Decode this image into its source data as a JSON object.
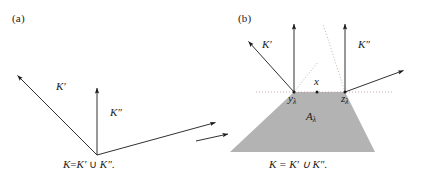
{
  "figure": {
    "background_color": "#ffffff",
    "line_color": "#1a1a1a",
    "shade_color": "#b0b0b0",
    "dotted_color": "#c8a8a8"
  },
  "panel_a": {
    "label": "(a)",
    "cone_left_label": "K′",
    "cone_right_label": "K″",
    "caption_k": "K",
    "caption_eq": "=",
    "caption_kp": "K′",
    "caption_union": "∪",
    "caption_kpp": "K″",
    "caption_period": ".",
    "caption_full": "K = K′ ∪ K″.",
    "vertex": [
      97,
      155
    ],
    "ray_upper_left_tip": [
      15,
      73
    ],
    "ray_vertical_tip": [
      97,
      86
    ],
    "ray_lower_right_tip": [
      218,
      121
    ]
  },
  "panel_b": {
    "label": "(b)",
    "cone_left_label": "K′",
    "cone_right_label": "K″",
    "point_x_label": "x",
    "vertex_left_label": "y",
    "vertex_left_sub": "λ",
    "vertex_right_label": "z",
    "vertex_right_sub": "λ",
    "region_label": "A",
    "region_sub": "λ",
    "caption_full": "K = K′ ∪ K″.",
    "apex_left": [
      294,
      92
    ],
    "apex_right": [
      345,
      92
    ],
    "region_vertices": [
      [
        294,
        92
      ],
      [
        345,
        92
      ],
      [
        375,
        152
      ],
      [
        230,
        152
      ]
    ]
  }
}
